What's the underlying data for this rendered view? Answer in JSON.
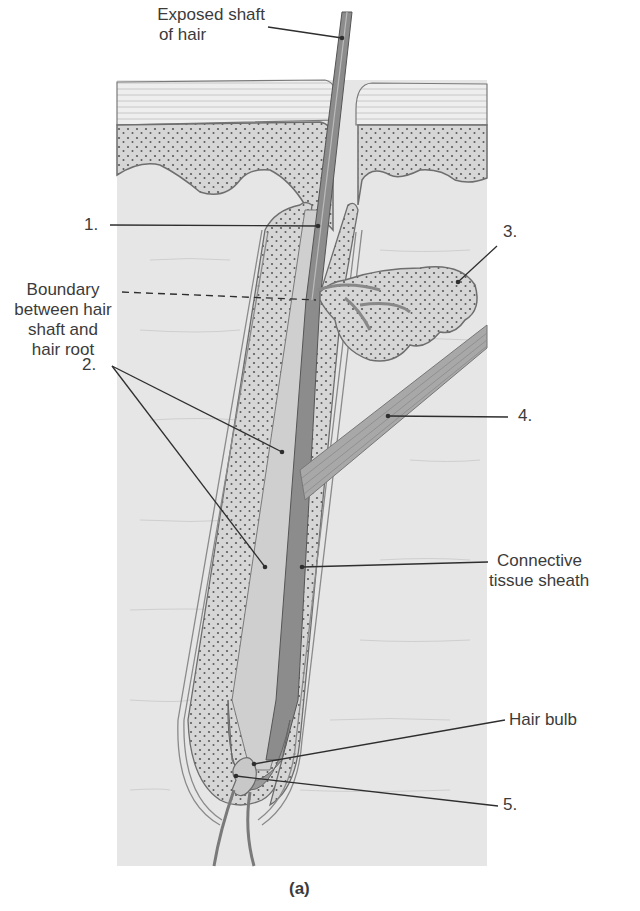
{
  "figure": {
    "caption": "(a)"
  },
  "labels": {
    "exposed_shaft": [
      "Exposed shaft",
      "of hair"
    ],
    "label_1": "1.",
    "boundary": [
      "Boundary",
      "between hair",
      "shaft and",
      "hair root"
    ],
    "label_2": "2.",
    "label_3": "3.",
    "label_4": "4.",
    "connective": [
      "Connective",
      "tissue sheath"
    ],
    "hair_bulb": "Hair bulb",
    "label_5": "5."
  },
  "colors": {
    "background": "#ffffff",
    "dermis": "#e6e6e6",
    "epidermis_stratum": "#ededed",
    "dotted_layer": "#d4d4d4",
    "dots": "#5a5a5a",
    "outline": "#6e6e6e",
    "hair_shaft": "#8a8a8a",
    "leader_line": "#2e2e2e",
    "text": "#3b3b3b"
  }
}
